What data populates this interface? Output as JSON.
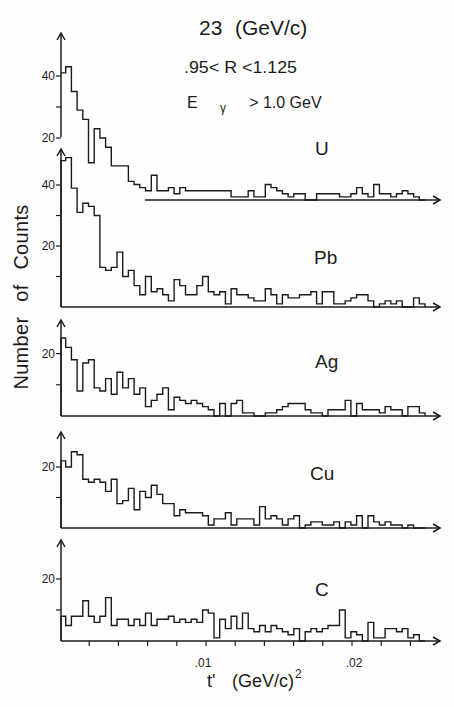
{
  "figure": {
    "title": {
      "value": "23",
      "unit": "(GeV/c)"
    },
    "cuts": {
      "r_range": ".95< R <1.125",
      "energy": {
        "symbol": "E",
        "subscript": "γ",
        "condition": "> 1.0 GeV"
      }
    },
    "y_axis_label": "Number of Counts",
    "x_axis_label": {
      "symbol": "t'",
      "unit": "(GeV/c)",
      "exponent": "2"
    },
    "x_tick_labels": [
      ".01",
      ".02"
    ]
  },
  "chart_data": {
    "type": "bar",
    "style": "step histogram, five vertically stacked panels sharing the x axis",
    "xlabel": "t' (GeV/c)^2",
    "ylabel": "Number of Counts",
    "x_range": [
      0,
      0.025
    ],
    "bin_count": 64,
    "bin_width": 0.00039,
    "x_ticks": [
      0.002,
      0.004,
      0.006,
      0.008,
      0.01,
      0.012,
      0.014,
      0.016,
      0.018,
      0.02,
      0.022,
      0.024
    ],
    "x_labeled_ticks": [
      0.01,
      0.02
    ],
    "x_tick_labels": [
      ".01",
      ".02"
    ],
    "grid": false,
    "legend": null,
    "series": [
      {
        "name": "U",
        "y_axis_visible_from": 20,
        "y_ticks": [
          20,
          30,
          40
        ],
        "y_tick_labels": [
          "40",
          "20"
        ],
        "ylim": [
          0,
          50
        ],
        "values": [
          41,
          43,
          35,
          29,
          26,
          12,
          23,
          20,
          17,
          11,
          11,
          11,
          6,
          5,
          4,
          3,
          8,
          3,
          3,
          4,
          2,
          4,
          3,
          3,
          3,
          3,
          3,
          3,
          3,
          3,
          1,
          1,
          1,
          3,
          1,
          1,
          5,
          4,
          3,
          2,
          1,
          2,
          2,
          0,
          0,
          2,
          2,
          2,
          2,
          1,
          1,
          2,
          4,
          2,
          1,
          5,
          2,
          2,
          1,
          2,
          3,
          2,
          1,
          0
        ]
      },
      {
        "name": "Pb",
        "y_ticks": [
          10,
          20,
          30,
          40
        ],
        "y_tick_labels": [
          "40",
          "20"
        ],
        "ylim": [
          0,
          52
        ],
        "values": [
          48,
          49,
          39,
          31,
          34,
          33,
          30,
          13,
          12,
          13,
          18,
          10,
          12,
          7,
          4,
          10,
          5,
          6,
          4,
          2,
          9,
          7,
          4,
          4,
          7,
          10,
          5,
          4,
          5,
          1,
          6,
          4,
          4,
          3,
          2,
          2,
          6,
          4,
          1,
          4,
          3,
          3,
          4,
          4,
          5,
          1,
          5,
          5,
          1,
          1,
          2,
          3,
          4,
          4,
          2,
          0,
          1,
          2,
          1,
          2,
          0,
          0,
          3,
          1
        ]
      },
      {
        "name": "Ag",
        "y_ticks": [
          10,
          20
        ],
        "y_tick_labels": [
          "20"
        ],
        "ylim": [
          0,
          31
        ],
        "values": [
          25,
          22,
          18,
          8,
          17,
          18,
          9,
          8,
          12,
          7,
          14,
          9,
          12,
          7,
          9,
          3,
          5,
          7,
          9,
          2,
          6,
          5,
          4,
          5,
          4,
          3,
          2,
          0,
          4,
          0,
          4,
          5,
          1,
          1,
          0,
          0,
          1,
          1,
          2,
          3,
          4,
          4,
          4,
          2,
          1,
          1,
          0,
          2,
          2,
          2,
          5,
          0,
          4,
          2,
          2,
          2,
          1,
          3,
          2,
          2,
          0,
          3,
          3,
          1
        ]
      },
      {
        "name": "Cu",
        "y_ticks": [
          10,
          20
        ],
        "y_tick_labels": [
          "20"
        ],
        "ylim": [
          0,
          31
        ],
        "values": [
          22,
          20,
          25,
          24,
          16,
          15,
          16,
          15,
          12,
          16,
          8,
          9,
          13,
          6,
          12,
          10,
          14,
          11,
          8,
          8,
          4,
          6,
          5,
          5,
          5,
          4,
          1,
          3,
          3,
          5,
          1,
          3,
          3,
          3,
          1,
          7,
          3,
          4,
          3,
          1,
          3,
          4,
          0,
          1,
          2,
          2,
          1,
          1,
          2,
          0,
          2,
          1,
          4,
          0,
          4,
          2,
          1,
          2,
          1,
          1,
          0,
          1,
          0,
          0
        ]
      },
      {
        "name": "C",
        "y_ticks": [
          10,
          20
        ],
        "y_tick_labels": [
          "20"
        ],
        "ylim": [
          0,
          32
        ],
        "values": [
          8,
          5,
          8,
          8,
          13,
          8,
          6,
          8,
          14,
          5,
          7,
          7,
          5,
          7,
          5,
          9,
          5,
          7,
          7,
          8,
          6,
          7,
          6,
          7,
          6,
          10,
          9,
          1,
          7,
          4,
          8,
          4,
          9,
          4,
          3,
          5,
          3,
          5,
          4,
          3,
          2,
          4,
          0,
          3,
          4,
          3,
          4,
          5,
          5,
          10,
          1,
          3,
          2,
          0,
          6,
          1,
          1,
          4,
          4,
          3,
          4,
          1,
          2,
          0
        ]
      }
    ]
  }
}
